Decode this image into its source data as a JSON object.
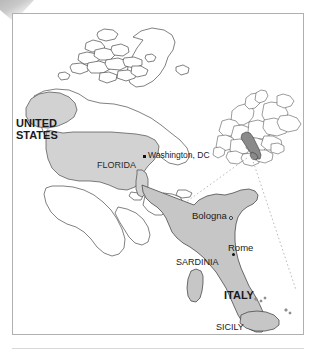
{
  "figure": {
    "type": "locator-map"
  },
  "colors": {
    "land_fill_light": "#d2d2d2",
    "land_fill_italy": "#c6c6c6",
    "land_fill_inset_highlight": "#8a8a8a",
    "outline": "#4a4a4a",
    "frame_border": "#b0b0b0",
    "text": "#1a1a1a",
    "callout_line": "#b4b4b4",
    "background": "#ffffff"
  },
  "labels": {
    "united_states": "UNITED\nSTATES",
    "united_states_line1": "UNITED",
    "united_states_line2": "STATES",
    "florida": "FLORIDA",
    "washington_dc": "Washington, DC",
    "bologna": "Bologna",
    "rome": "Rome",
    "sardinia": "SARDINIA",
    "italy": "ITALY",
    "sicily": "SICILY"
  },
  "markers": [
    {
      "name": "washington-dc-marker",
      "label": "Washington, DC",
      "shape": "square",
      "x": 143,
      "y": 155
    },
    {
      "name": "bologna-marker",
      "label": "Bologna",
      "shape": "circle-open",
      "x": 229,
      "y": 216
    },
    {
      "name": "rome-marker",
      "label": "Rome",
      "shape": "circle-filled",
      "x": 232,
      "y": 253
    }
  ],
  "regions": [
    {
      "name": "united-states",
      "label": "UNITED STATES",
      "shaded": true
    },
    {
      "name": "florida",
      "label": "FLORIDA",
      "shaded": true
    },
    {
      "name": "italy",
      "label": "ITALY",
      "shaded": true
    },
    {
      "name": "sardinia",
      "label": "SARDINIA",
      "shaded": true
    },
    {
      "name": "sicily",
      "label": "SICILY",
      "shaded": true
    }
  ],
  "insets": [
    {
      "name": "europe-inset",
      "highlighted_country": "Italy"
    }
  ],
  "callouts": [
    {
      "name": "callout-line-upper",
      "from": "europe-inset-italy",
      "to": "italy-map-north"
    },
    {
      "name": "callout-line-lower",
      "from": "europe-inset-italy",
      "to": "italy-map-southeast"
    }
  ]
}
